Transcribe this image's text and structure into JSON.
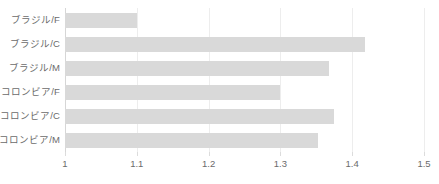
{
  "chart_data": {
    "type": "bar",
    "orientation": "horizontal",
    "title": "",
    "subtitle": "",
    "xlabel": "",
    "ylabel": "",
    "xlim": [
      1,
      1.5
    ],
    "ylim": null,
    "grid": true,
    "legend": false,
    "legend_position": "none",
    "bar_color": "#d9d9d9",
    "gridline_color": "#ededed",
    "axis_color": "#d6d6d6",
    "text_color": "#6b6b6b",
    "categories": [
      "ブラジル/F",
      "ブラジル/C",
      "ブラジル/M",
      "コロンビア/F",
      "コロンビア/C",
      "コロンビア/M"
    ],
    "values": [
      1.1,
      1.418,
      1.368,
      1.3,
      1.375,
      1.353
    ],
    "xticks": [
      1,
      1.1,
      1.2,
      1.3,
      1.4,
      1.5
    ],
    "xticklabels": [
      "1",
      "1.1",
      "1.2",
      "1.3",
      "1.4",
      "1.5"
    ],
    "series": [
      {
        "name": "",
        "values": [
          1.1,
          1.418,
          1.368,
          1.3,
          1.375,
          1.353
        ]
      }
    ]
  }
}
